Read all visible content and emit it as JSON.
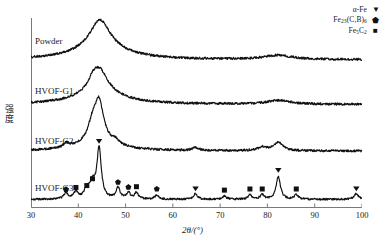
{
  "chart_data": {
    "type": "line",
    "title": "",
    "xlabel": "2θ/(°)",
    "ylabel": "强度",
    "xlim": [
      30,
      100
    ],
    "ylim": [
      0,
      1
    ],
    "grid": false,
    "xticks": [
      30,
      40,
      50,
      60,
      70,
      80,
      90,
      100
    ],
    "xticklabels": [
      "30",
      "40",
      "50",
      "60",
      "70",
      "80",
      "90",
      "100"
    ],
    "legend_position": "top-right",
    "legend": [
      {
        "label": "α-Fe",
        "marker": "down-triangle-filled",
        "marker_glyph": "▼"
      },
      {
        "label": "Fe23(C,B)6",
        "marker": "pentagon-filled",
        "marker_glyph": "⬟"
      },
      {
        "label": "Fe5C2",
        "marker": "square-filled",
        "marker_glyph": "■"
      }
    ],
    "series": [
      {
        "name": "Powder",
        "label": "Powder",
        "baseline_offset": 0.78,
        "peaks": [
          {
            "x": 44.6,
            "height": 0.155,
            "width": 5.2
          },
          {
            "x": 44.6,
            "height": 0.055,
            "width": 14.0
          },
          {
            "x": 82.3,
            "height": 0.022,
            "width": 7.0
          }
        ],
        "noise": 0.006
      },
      {
        "name": "HVOF-G1",
        "label": "HVOF-G1",
        "baseline_offset": 0.545,
        "peaks": [
          {
            "x": 44.4,
            "height": 0.135,
            "width": 4.4
          },
          {
            "x": 44.4,
            "height": 0.05,
            "width": 13.0
          },
          {
            "x": 82.3,
            "height": 0.02,
            "width": 6.0
          },
          {
            "x": 43.0,
            "height": 0.03,
            "width": 2.0
          }
        ],
        "noise": 0.006
      },
      {
        "name": "HVOF-G2",
        "label": "HVOF-G2",
        "baseline_offset": 0.3,
        "peaks": [
          {
            "x": 44.4,
            "height": 0.195,
            "width": 2.2
          },
          {
            "x": 43.0,
            "height": 0.085,
            "width": 2.2
          },
          {
            "x": 44.4,
            "height": 0.055,
            "width": 9.0
          },
          {
            "x": 82.3,
            "height": 0.045,
            "width": 2.2
          },
          {
            "x": 37.5,
            "height": 0.022,
            "width": 1.6
          },
          {
            "x": 48.0,
            "height": 0.018,
            "width": 1.4
          },
          {
            "x": 64.8,
            "height": 0.015,
            "width": 1.6
          },
          {
            "x": 79.0,
            "height": 0.018,
            "width": 2.5
          }
        ],
        "noise": 0.006
      },
      {
        "name": "HVOF-G3",
        "label": "HVOF-G3",
        "baseline_offset": 0.045,
        "peaks": [
          {
            "x": 44.4,
            "height": 0.265,
            "width": 1.1
          },
          {
            "x": 43.0,
            "height": 0.075,
            "width": 1.4
          },
          {
            "x": 41.8,
            "height": 0.045,
            "width": 1.3
          },
          {
            "x": 39.5,
            "height": 0.035,
            "width": 1.1
          },
          {
            "x": 37.4,
            "height": 0.03,
            "width": 1.1
          },
          {
            "x": 48.4,
            "height": 0.058,
            "width": 1.0
          },
          {
            "x": 50.6,
            "height": 0.032,
            "width": 1.0
          },
          {
            "x": 52.3,
            "height": 0.034,
            "width": 1.0
          },
          {
            "x": 56.6,
            "height": 0.022,
            "width": 1.0
          },
          {
            "x": 64.8,
            "height": 0.03,
            "width": 1.0
          },
          {
            "x": 70.9,
            "height": 0.018,
            "width": 1.0
          },
          {
            "x": 76.3,
            "height": 0.024,
            "width": 1.0
          },
          {
            "x": 78.9,
            "height": 0.024,
            "width": 1.0
          },
          {
            "x": 82.3,
            "height": 0.12,
            "width": 1.1
          },
          {
            "x": 86.1,
            "height": 0.024,
            "width": 1.0
          },
          {
            "x": 98.8,
            "height": 0.03,
            "width": 1.1
          }
        ],
        "noise": 0.005,
        "markers": [
          {
            "x": 37.4,
            "y_offset": 0.04,
            "type": "pentagon"
          },
          {
            "x": 39.5,
            "y_offset": 0.052,
            "type": "square"
          },
          {
            "x": 41.8,
            "y_offset": 0.062,
            "type": "square"
          },
          {
            "x": 43.0,
            "y_offset": 0.098,
            "type": "square"
          },
          {
            "x": 44.4,
            "y_offset": 0.3,
            "type": "triangle"
          },
          {
            "x": 48.4,
            "y_offset": 0.078,
            "type": "pentagon"
          },
          {
            "x": 50.6,
            "y_offset": 0.052,
            "type": "pentagon"
          },
          {
            "x": 52.3,
            "y_offset": 0.056,
            "type": "square"
          },
          {
            "x": 56.6,
            "y_offset": 0.042,
            "type": "pentagon"
          },
          {
            "x": 64.8,
            "y_offset": 0.05,
            "type": "triangle"
          },
          {
            "x": 70.9,
            "y_offset": 0.038,
            "type": "square"
          },
          {
            "x": 76.3,
            "y_offset": 0.044,
            "type": "square"
          },
          {
            "x": 78.9,
            "y_offset": 0.044,
            "type": "square"
          },
          {
            "x": 82.3,
            "y_offset": 0.148,
            "type": "triangle"
          },
          {
            "x": 86.1,
            "y_offset": 0.044,
            "type": "square"
          },
          {
            "x": 98.8,
            "y_offset": 0.05,
            "type": "triangle"
          }
        ]
      }
    ],
    "curve_color": "#111111",
    "axis_color": "#7a7a7a"
  },
  "legend": {
    "items": [
      {
        "label_main": "α-Fe",
        "sub1": "",
        "mid": "",
        "sub2": "",
        "glyph": "▼"
      },
      {
        "label_main": "Fe",
        "sub1": "23",
        "mid": "(C,B)",
        "sub2": "6",
        "glyph": "⬟"
      },
      {
        "label_main": "Fe",
        "sub1": "5",
        "mid": "C",
        "sub2": "2",
        "glyph": "■"
      }
    ]
  },
  "axes": {
    "ylabel": "强度",
    "ylabel_chars": [
      "强",
      "度"
    ],
    "xlabel_prefix": "2",
    "xlabel_theta": "θ",
    "xlabel_suffix": "/(°)"
  },
  "curve_labels": [
    {
      "text": "Powder",
      "left": 35,
      "top": 36
    },
    {
      "text": "HVOF-G1",
      "left": 35,
      "top": 86
    },
    {
      "text": "HVOF-G2",
      "left": 35,
      "top": 136
    },
    {
      "text": "HVOF-G3",
      "left": 35,
      "top": 183
    }
  ]
}
